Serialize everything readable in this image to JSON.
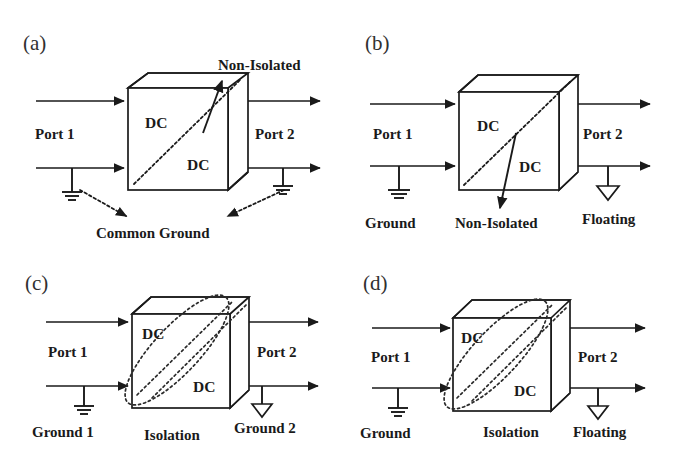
{
  "figure": {
    "background_color": "#ffffff",
    "ink_color": "#1a1a1a",
    "panel_count": 4
  },
  "panels": [
    {
      "id": "a",
      "letter": "(a)",
      "block_labels": [
        "DC",
        "DC"
      ],
      "port_left": "Port 1",
      "port_right": "Port 2",
      "isolation_label": "Non-Isolated",
      "ground_left": "",
      "ground_right": "",
      "bottom_label": "Common Ground",
      "ground_left_symbol": "earth-ground",
      "ground_right_symbol": "earth-ground",
      "has_isolation_ellipse": false,
      "pointer_direction": "up-left-into-cube"
    },
    {
      "id": "b",
      "letter": "(b)",
      "block_labels": [
        "DC",
        "DC"
      ],
      "port_left": "Port 1",
      "port_right": "Port 2",
      "isolation_label": "Non-Isolated",
      "ground_left": "Ground",
      "ground_right": "Floating",
      "bottom_label": "",
      "ground_left_symbol": "earth-ground",
      "ground_right_symbol": "floating-triangle",
      "has_isolation_ellipse": false,
      "pointer_direction": "down-left-from-cube"
    },
    {
      "id": "c",
      "letter": "(c)",
      "block_labels": [
        "DC",
        "DC"
      ],
      "port_left": "Port 1",
      "port_right": "Port 2",
      "isolation_label": "Isolation",
      "ground_left": "Ground 1",
      "ground_right": "Ground 2",
      "bottom_label": "",
      "ground_left_symbol": "earth-ground",
      "ground_right_symbol": "floating-triangle",
      "has_isolation_ellipse": true,
      "pointer_direction": "none"
    },
    {
      "id": "d",
      "letter": "(d)",
      "block_labels": [
        "DC",
        "DC"
      ],
      "port_left": "Port 1",
      "port_right": "Port 2",
      "isolation_label": "Isolation",
      "ground_left": "Ground",
      "ground_right": "Floating",
      "bottom_label": "",
      "ground_left_symbol": "earth-ground",
      "ground_right_symbol": "floating-triangle",
      "has_isolation_ellipse": true,
      "pointer_direction": "none"
    }
  ]
}
